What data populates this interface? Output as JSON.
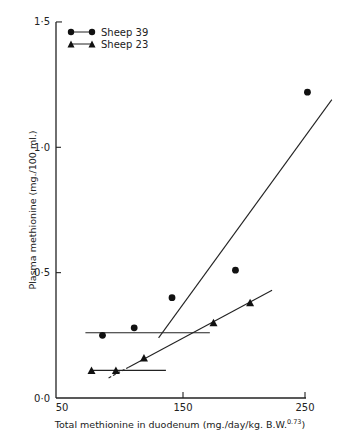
{
  "chart_data": {
    "type": "scatter",
    "title": "",
    "xlabel": "Total methionine in duodenum (mg./day/kg. B.W.",
    "xlabel_superscript": "0.73",
    "xlabel_close": ")",
    "ylabel": "Plasma methionine (mg./100 ml.)",
    "xlim": [
      50,
      250
    ],
    "ylim": [
      0.0,
      1.5
    ],
    "x_ticks": [
      50,
      150,
      250
    ],
    "x_tick_labels": [
      "50",
      "150",
      "250"
    ],
    "y_ticks": [
      0.0,
      0.5,
      1.0,
      1.5
    ],
    "y_tick_labels": [
      "0·0",
      "0·5",
      "1·0",
      "1·5"
    ],
    "grid": false,
    "legend_position": "upper-left",
    "series": [
      {
        "name": "Sheep 39",
        "marker": "circle",
        "points": [
          {
            "x": 84,
            "y": 0.25
          },
          {
            "x": 110,
            "y": 0.28
          },
          {
            "x": 141,
            "y": 0.4
          },
          {
            "x": 193,
            "y": 0.51
          },
          {
            "x": 252,
            "y": 1.22
          }
        ],
        "fit_lines": [
          {
            "style": "solid",
            "x1": 70,
            "y1": 0.26,
            "x2": 172,
            "y2": 0.26
          },
          {
            "style": "solid",
            "x1": 130,
            "y1": 0.24,
            "x2": 272,
            "y2": 1.19
          }
        ]
      },
      {
        "name": "Sheep 23",
        "marker": "triangle",
        "points": [
          {
            "x": 75,
            "y": 0.11
          },
          {
            "x": 95,
            "y": 0.11
          },
          {
            "x": 118,
            "y": 0.16
          },
          {
            "x": 175,
            "y": 0.3
          },
          {
            "x": 205,
            "y": 0.38
          }
        ],
        "fit_lines": [
          {
            "style": "solid",
            "x1": 74,
            "y1": 0.11,
            "x2": 136,
            "y2": 0.11
          },
          {
            "style": "dashed-then-solid",
            "x1": 89,
            "y1": 0.08,
            "x2": 223,
            "y2": 0.43
          }
        ]
      }
    ]
  },
  "legend": {
    "items": [
      {
        "label": "Sheep 39",
        "marker": "circle"
      },
      {
        "label": "Sheep 23",
        "marker": "triangle"
      }
    ]
  }
}
